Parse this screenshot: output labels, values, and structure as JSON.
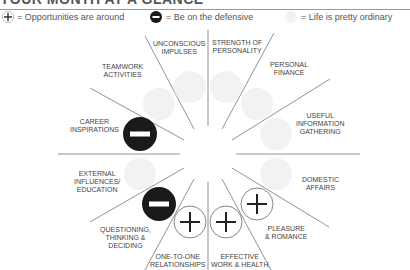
{
  "header": {
    "title": "YOUR MONTH AT A GLANCE"
  },
  "legend": [
    {
      "icon": "cross-circle-icon",
      "label": "= Opportunities are around"
    },
    {
      "icon": "minus-circle-icon",
      "label": "= Be on the defensive"
    },
    {
      "icon": "faint-circle-icon",
      "label": "= Life is pretty ordinary"
    }
  ],
  "colors": {
    "defensive": "#1a1a1a",
    "ordinary": "#f2f2f2",
    "line": "#777777"
  },
  "houses": [
    {
      "label_lines": [
        "STRENGTH OF",
        "PERSONALITY"
      ],
      "status": "ordinary"
    },
    {
      "label_lines": [
        "PERSONAL",
        "FINANCE"
      ],
      "status": "ordinary"
    },
    {
      "label_lines": [
        "USEFUL",
        "INFORMATION",
        "GATHERING"
      ],
      "status": "ordinary"
    },
    {
      "label_lines": [
        "DOMESTIC",
        "AFFAIRS"
      ],
      "status": "ordinary"
    },
    {
      "label_lines": [
        "PLEASURE",
        "& ROMANCE"
      ],
      "status": "opportunity"
    },
    {
      "label_lines": [
        "EFFECTIVE",
        "WORK & HEALTH"
      ],
      "status": "opportunity"
    },
    {
      "label_lines": [
        "ONE-TO-ONE",
        "RELATIONSHIPS"
      ],
      "status": "opportunity"
    },
    {
      "label_lines": [
        "QUESTIONING,",
        "THINKING &",
        "DECIDING"
      ],
      "status": "defensive"
    },
    {
      "label_lines": [
        "EXTERNAL",
        "INFLUENCES/",
        "EDUCATION"
      ],
      "status": "ordinary"
    },
    {
      "label_lines": [
        "CAREER",
        "INSPIRATIONS"
      ],
      "status": "defensive"
    },
    {
      "label_lines": [
        "TEAMWORK",
        "ACTIVITIES"
      ],
      "status": "ordinary"
    },
    {
      "label_lines": [
        "UNCONSCIOUS",
        "IMPULSES"
      ],
      "status": "ordinary"
    }
  ]
}
